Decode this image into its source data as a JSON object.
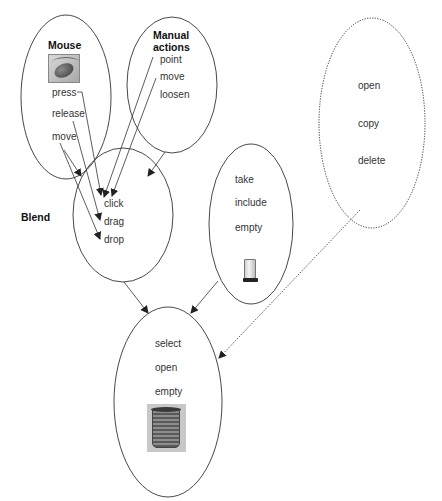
{
  "diagram": {
    "nodes": {
      "mouse": {
        "title": "Mouse",
        "items": [
          "press",
          "release",
          "move"
        ],
        "image": "mouse-icon"
      },
      "manual": {
        "title_line1": "Manual",
        "title_line2": "actions",
        "items": [
          "point",
          "move",
          "loosen"
        ]
      },
      "blend": {
        "label": "Blend",
        "items": [
          "click",
          "drag",
          "drop"
        ]
      },
      "container": {
        "items": [
          "take",
          "include",
          "empty"
        ],
        "image": "glass-container-icon"
      },
      "computer": {
        "items": [
          "open",
          "copy",
          "delete"
        ],
        "style": "dotted"
      },
      "result": {
        "items": [
          "select",
          "open",
          "empty"
        ],
        "image": "trash-bin-icon"
      }
    },
    "edges": [
      {
        "from": "mouse.press",
        "to": "blend.click",
        "style": "solid"
      },
      {
        "from": "mouse.release",
        "to": "blend.drag",
        "style": "solid"
      },
      {
        "from": "mouse.move",
        "to": "blend.drop",
        "style": "solid"
      },
      {
        "from": "mouse",
        "to": "blend",
        "style": "solid"
      },
      {
        "from": "manual.point",
        "to": "blend.click",
        "style": "solid"
      },
      {
        "from": "manual.move",
        "to": "blend.click",
        "style": "solid"
      },
      {
        "from": "manual",
        "to": "blend",
        "style": "solid"
      },
      {
        "from": "blend",
        "to": "result",
        "style": "solid"
      },
      {
        "from": "container",
        "to": "result",
        "style": "solid"
      },
      {
        "from": "computer",
        "to": "result",
        "style": "dotted"
      }
    ],
    "colors": {
      "line": "#333333",
      "text": "#333333",
      "background": "#ffffff"
    }
  }
}
